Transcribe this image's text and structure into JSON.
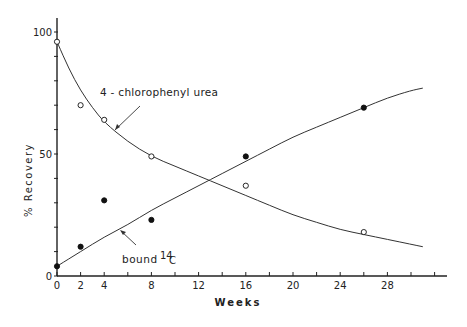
{
  "chart_data": {
    "type": "line",
    "title": "",
    "xlabel": "Weeks",
    "ylabel": "% Recovery",
    "xlim": [
      0,
      32
    ],
    "ylim": [
      0,
      100
    ],
    "x_ticks": [
      0,
      2,
      4,
      8,
      12,
      16,
      20,
      24,
      28
    ],
    "x_tick_labels": [
      "0",
      "2",
      "4",
      "8",
      "12",
      "16",
      "20",
      "24",
      "28"
    ],
    "y_ticks": [
      0,
      50,
      100
    ],
    "y_tick_labels": [
      "0",
      "50",
      "100"
    ],
    "grid": false,
    "legend": "inline annotations with arrows",
    "series": [
      {
        "name": "4-chlorophenyl urea",
        "marker": "open-circle",
        "x": [
          0,
          2,
          4,
          8,
          16,
          26
        ],
        "values": [
          96,
          70,
          64,
          49,
          37,
          18
        ],
        "fit_curve": [
          [
            0,
            96
          ],
          [
            1,
            85
          ],
          [
            2,
            76
          ],
          [
            3,
            69
          ],
          [
            4,
            63
          ],
          [
            6,
            55
          ],
          [
            8,
            49
          ],
          [
            10,
            45
          ],
          [
            12,
            41
          ],
          [
            14,
            37
          ],
          [
            16,
            33
          ],
          [
            18,
            29
          ],
          [
            20,
            25
          ],
          [
            22,
            22
          ],
          [
            24,
            19
          ],
          [
            26,
            17
          ],
          [
            28,
            15
          ],
          [
            30,
            13
          ],
          [
            31,
            12
          ]
        ]
      },
      {
        "name": "bound 14C",
        "marker": "filled-circle",
        "x": [
          0,
          2,
          4,
          8,
          16,
          26
        ],
        "values": [
          4,
          12,
          31,
          23,
          49,
          69
        ],
        "fit_curve": [
          [
            0,
            4
          ],
          [
            2,
            10
          ],
          [
            4,
            16
          ],
          [
            6,
            21
          ],
          [
            8,
            27
          ],
          [
            10,
            32
          ],
          [
            12,
            37
          ],
          [
            14,
            42
          ],
          [
            16,
            47
          ],
          [
            18,
            52
          ],
          [
            20,
            57
          ],
          [
            22,
            61
          ],
          [
            24,
            65
          ],
          [
            26,
            69
          ],
          [
            28,
            73
          ],
          [
            30,
            76
          ],
          [
            31,
            77
          ]
        ]
      }
    ],
    "annotations": [
      {
        "text": "4-chlorophenyl urea",
        "target_series": "4-chlorophenyl urea"
      },
      {
        "text": "bound",
        "superscript": "14",
        "suffix": "C",
        "target_series": "bound 14C"
      }
    ]
  },
  "labels": {
    "xlabel": "Weeks",
    "ylabel": "% Recovery",
    "annot_urea": "4 - chlorophenyl  urea",
    "annot_bound": "bound",
    "annot_bound_sup": "14",
    "annot_bound_c": "C"
  }
}
